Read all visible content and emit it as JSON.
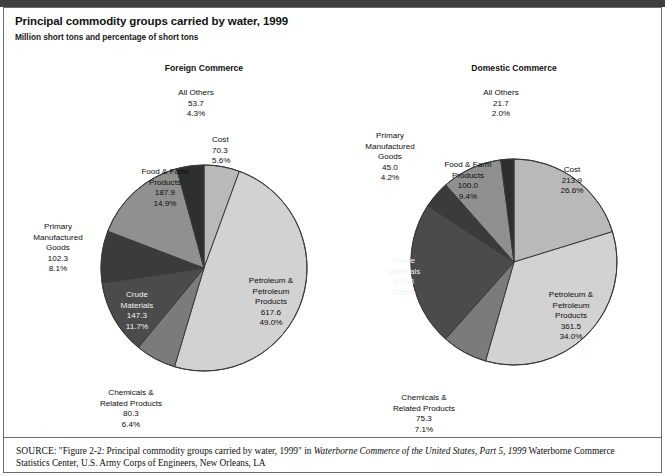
{
  "figure": {
    "title": "Principal commodity groups carried by water, 1999",
    "subtitle": "Million short tons and percentage of short tons",
    "source_prefix": "SOURCE:",
    "source_quote": "\"Figure 2-2: Principal commodity groups carried by water, 1999\"",
    "source_in": "in",
    "source_italic": "Waterborne Commerce of the United States, Part 5, 1999",
    "source_tail": "Waterborne Commerce Statistics Center, U.S. Army Corps of Engineers, New Orleans, LA"
  },
  "colors": {
    "cost": "#b9b9b9",
    "petroleum": "#d2d2d2",
    "chemicals": "#7b7b7b",
    "crude": "#4b4b4b",
    "primary": "#3b3b3b",
    "food": "#909090",
    "all_others": "#2e2e2e",
    "slice_stroke": "#3a3a3a",
    "frame": "#6b6b6b",
    "top_rule": "#3f3f3f"
  },
  "chart_data": [
    {
      "type": "pie",
      "title": "Foreign Commerce",
      "unit": "million short tons",
      "total": 1259.4,
      "start_angle_deg": 0,
      "direction": "clockwise",
      "categories": [
        "Cost",
        "Petroleum & Petroleum Products",
        "Chemicals & Related Products",
        "Crude Materials",
        "Primary Manufactured Goods",
        "Food & Farm Products",
        "All Others"
      ],
      "values": [
        70.3,
        617.6,
        80.3,
        147.3,
        102.3,
        187.9,
        53.7
      ],
      "percents": [
        5.6,
        49.0,
        6.4,
        11.7,
        8.1,
        14.9,
        4.3
      ],
      "slices": [
        {
          "key": "cost",
          "name": "Cost",
          "name_lines": [
            "Cost"
          ],
          "value": "70.3",
          "percent": "5.6%",
          "color": "#b9b9b9"
        },
        {
          "key": "petroleum",
          "name": "Petroleum & Petroleum Products",
          "name_lines": [
            "Petroleum &",
            "Petroleum",
            "Products"
          ],
          "value": "617.6",
          "percent": "49.0%",
          "color": "#d2d2d2"
        },
        {
          "key": "chemicals",
          "name": "Chemicals & Related Products",
          "name_lines": [
            "Chemicals &",
            "Related Products"
          ],
          "value": "80.3",
          "percent": "6.4%",
          "color": "#7b7b7b"
        },
        {
          "key": "crude",
          "name": "Crude Materials",
          "name_lines": [
            "Crude",
            "Materials"
          ],
          "value": "147.3",
          "percent": "11.7%",
          "color": "#4b4b4b"
        },
        {
          "key": "primary",
          "name": "Primary Manufactured Goods",
          "name_lines": [
            "Primary",
            "Manufactured",
            "Goods"
          ],
          "value": "102.3",
          "percent": "8.1%",
          "color": "#3b3b3b"
        },
        {
          "key": "food",
          "name": "Food & Farm Products",
          "name_lines": [
            "Food & Farm",
            "Products"
          ],
          "value": "187.9",
          "percent": "14.9%",
          "color": "#909090"
        },
        {
          "key": "all_others",
          "name": "All Others",
          "name_lines": [
            "All Others"
          ],
          "value": "53.7",
          "percent": "4.3%",
          "color": "#2e2e2e"
        }
      ]
    },
    {
      "type": "pie",
      "title": "Domestic Commerce",
      "unit": "million short tons",
      "total": 1056.7,
      "start_angle_deg": 0,
      "direction": "clockwise",
      "categories": [
        "Cost",
        "Petroleum & Petroleum Products",
        "Chemicals & Related Products",
        "Crude Materials",
        "Primary Manufactured Goods",
        "Food & Farm Products",
        "All Others"
      ],
      "values": [
        213.9,
        361.5,
        75.3,
        239.3,
        45.0,
        100.0,
        21.7
      ],
      "percents": [
        26.6,
        34.0,
        7.1,
        22.5,
        4.2,
        9.4,
        2.0
      ],
      "slices": [
        {
          "key": "cost",
          "name": "Cost",
          "name_lines": [
            "Cost"
          ],
          "value": "213.9",
          "percent": "26.6%",
          "color": "#b9b9b9"
        },
        {
          "key": "petroleum",
          "name": "Petroleum & Petroleum Products",
          "name_lines": [
            "Petroleum &",
            "Petroleum",
            "Products"
          ],
          "value": "361.5",
          "percent": "34.0%",
          "color": "#d2d2d2"
        },
        {
          "key": "chemicals",
          "name": "Chemicals & Related Products",
          "name_lines": [
            "Chemicals &",
            "Related Products"
          ],
          "value": "75.3",
          "percent": "7.1%",
          "color": "#7b7b7b"
        },
        {
          "key": "crude",
          "name": "Crude Materials",
          "name_lines": [
            "Crude",
            "Materials"
          ],
          "value": "239.3",
          "percent": "22.5%",
          "color": "#4b4b4b"
        },
        {
          "key": "primary",
          "name": "Primary Manufactured Goods",
          "name_lines": [
            "Primary",
            "Manufactured",
            "Goods"
          ],
          "value": "45.0",
          "percent": "4.2%",
          "color": "#3b3b3b"
        },
        {
          "key": "food",
          "name": "Food & Farm Products",
          "name_lines": [
            "Food & Farm",
            "Products"
          ],
          "value": "100.0",
          "percent": "9.4%",
          "color": "#909090"
        },
        {
          "key": "all_others",
          "name": "All Others",
          "name_lines": [
            "All Others"
          ],
          "value": "21.7",
          "percent": "2.0%",
          "color": "#2e2e2e"
        }
      ]
    }
  ],
  "labels": {
    "left": {
      "all_others": {
        "x": 196,
        "y": 88,
        "align": "center",
        "dark": false
      },
      "cost": {
        "x": 212,
        "y": 135,
        "align": "left",
        "dark": false
      },
      "food": {
        "x": 165,
        "y": 167,
        "align": "center",
        "dark": false
      },
      "primary": {
        "x": 58,
        "y": 222,
        "align": "center",
        "dark": false
      },
      "crude": {
        "x": 137,
        "y": 290,
        "align": "center",
        "dark": true
      },
      "chemicals": {
        "x": 131,
        "y": 388,
        "align": "center",
        "dark": false
      },
      "petroleum": {
        "x": 271,
        "y": 276,
        "align": "center",
        "dark": false
      }
    },
    "right": {
      "all_others": {
        "x": 501,
        "y": 88,
        "align": "center",
        "dark": false
      },
      "primary": {
        "x": 390,
        "y": 131,
        "align": "center",
        "dark": false
      },
      "food": {
        "x": 468,
        "y": 160,
        "align": "center",
        "dark": false
      },
      "cost": {
        "x": 572,
        "y": 165,
        "align": "center",
        "dark": false
      },
      "crude": {
        "x": 404,
        "y": 256,
        "align": "center",
        "dark": true
      },
      "petroleum": {
        "x": 571,
        "y": 290,
        "align": "center",
        "dark": false
      },
      "chemicals": {
        "x": 424,
        "y": 393,
        "align": "center",
        "dark": false
      }
    }
  },
  "geometry": {
    "left": {
      "cx": 204,
      "cy": 268,
      "r": 103,
      "title_x": 204,
      "title_y": 63
    },
    "right": {
      "cx": 514,
      "cy": 262,
      "r": 103,
      "title_x": 514,
      "title_y": 63
    }
  }
}
